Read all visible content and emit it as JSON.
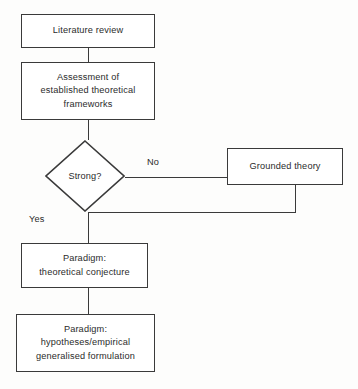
{
  "diagram": {
    "type": "flowchart",
    "colors": {
      "background": "#fdfdfc",
      "node_fill": "#ffffff",
      "stroke": "#3a3a3a",
      "text": "#2b2b2b"
    },
    "nodes": [
      {
        "id": "literature-review",
        "shape": "rectangle",
        "lines": [
          "Literature review"
        ]
      },
      {
        "id": "assessment",
        "shape": "rectangle",
        "lines": [
          "Assessment of",
          "established theoretical",
          "frameworks"
        ]
      },
      {
        "id": "decision-strong",
        "shape": "diamond",
        "lines": [
          "Strong?"
        ]
      },
      {
        "id": "grounded-theory",
        "shape": "rectangle",
        "lines": [
          "Grounded theory"
        ]
      },
      {
        "id": "paradigm-theoretical",
        "shape": "rectangle",
        "lines": [
          "Paradigm:",
          "theoretical conjecture"
        ]
      },
      {
        "id": "paradigm-hypotheses",
        "shape": "rectangle",
        "lines": [
          "Paradigm:",
          "hypotheses/empirical",
          "generalised formulation"
        ]
      }
    ],
    "edge_labels": {
      "no": "No",
      "yes": "Yes"
    },
    "edges": [
      {
        "from": "literature-review",
        "to": "assessment",
        "label": ""
      },
      {
        "from": "assessment",
        "to": "decision-strong",
        "label": ""
      },
      {
        "from": "decision-strong",
        "to": "grounded-theory",
        "label": "No"
      },
      {
        "from": "grounded-theory",
        "to": "decision-strong",
        "label": ""
      },
      {
        "from": "decision-strong",
        "to": "paradigm-theoretical",
        "label": "Yes"
      },
      {
        "from": "paradigm-theoretical",
        "to": "paradigm-hypotheses",
        "label": ""
      }
    ]
  }
}
